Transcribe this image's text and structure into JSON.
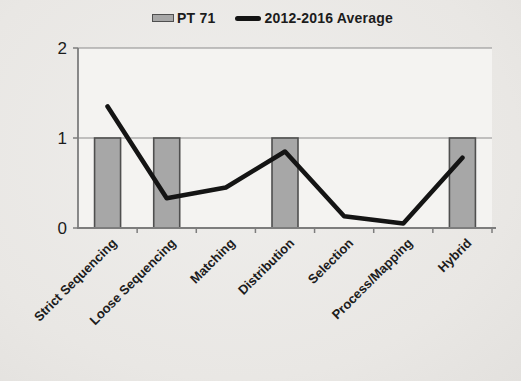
{
  "legend": {
    "items": [
      {
        "label": "PT 71",
        "swatch": "bar-swatch"
      },
      {
        "label": "2012-2016 Average",
        "swatch": "line-swatch"
      }
    ],
    "position": "top-center"
  },
  "colors": {
    "bar_fill": "#a7a7a7",
    "bar_border": "#4f4f4f",
    "line": "#141414",
    "axis": "#7d7d7d",
    "grid": "#8c8c8c",
    "plot_bg": "#f4f3f1",
    "text": "#1c1c1c"
  },
  "chart_data": {
    "type": "bar+line",
    "title": "",
    "xlabel": "",
    "ylabel": "",
    "categories": [
      "Strict Sequencing",
      "Loose Sequencing",
      "Matching",
      "Distribution",
      "Selection",
      "Process/Mapping",
      "Hybrid"
    ],
    "series": [
      {
        "name": "PT 71",
        "type": "bar",
        "values": [
          1,
          1,
          0,
          1,
          0,
          0,
          1
        ]
      },
      {
        "name": "2012-2016 Average",
        "type": "line",
        "values": [
          1.35,
          0.33,
          0.45,
          0.85,
          0.13,
          0.05,
          0.78
        ]
      }
    ],
    "ylim": [
      0,
      2
    ],
    "yticks": [
      0,
      1,
      2
    ],
    "grid": "horizontal",
    "legend_position": "top",
    "x_label_rotation_deg": -45
  }
}
